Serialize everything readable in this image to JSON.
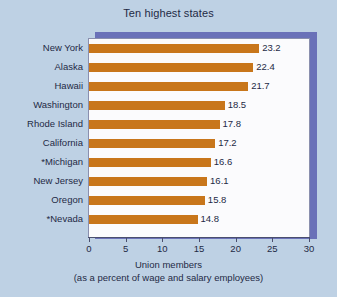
{
  "figure": {
    "background_color": "#bed1e4",
    "panel_color": "#fbfbfd",
    "panel_shadow_color": "#6a71b8",
    "bar_color": "#c8761b",
    "text_color": "#1e2a45",
    "axis_color": "#4a4f6e"
  },
  "chart_data": {
    "type": "bar",
    "orientation": "horizontal",
    "title": "Ten highest states",
    "xlabel": "Union members",
    "xlabel_sub": "(as a percent of wage and salary employees)",
    "ylabel": "",
    "xlim": [
      0,
      30
    ],
    "xticks": [
      0,
      5,
      10,
      15,
      20,
      25,
      30
    ],
    "xtick_labels": [
      "0",
      "5",
      "10",
      "15",
      "20",
      "25",
      "30"
    ],
    "grid": false,
    "legend": false,
    "bar_labels_shown": true,
    "categories": [
      "New York",
      "Alaska",
      "Hawaii",
      "Washington",
      "Rhode Island",
      "California",
      "*Michigan",
      "New Jersey",
      "Oregon",
      "*Nevada"
    ],
    "values": [
      23.2,
      22.4,
      21.7,
      18.5,
      17.8,
      17.2,
      16.6,
      16.1,
      15.8,
      14.8
    ],
    "value_labels": [
      "23.2",
      "22.4",
      "21.7",
      "18.5",
      "17.8",
      "17.2",
      "16.6",
      "16.1",
      "15.8",
      "14.8"
    ]
  }
}
